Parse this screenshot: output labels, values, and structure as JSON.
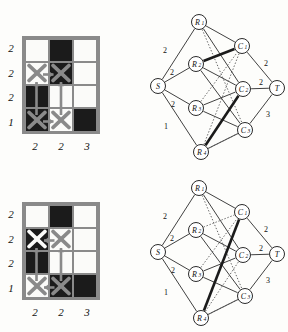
{
  "figure": {
    "panels": [
      {
        "id": "panel-top",
        "grid": {
          "row_labels": [
            "2",
            "2",
            "2",
            "1"
          ],
          "col_labels": [
            "2",
            "2",
            "3"
          ],
          "cells": [
            [
              {
                "fill": "white",
                "x": "none"
              },
              {
                "fill": "black",
                "x": "none"
              },
              {
                "fill": "white",
                "x": "none"
              }
            ],
            [
              {
                "fill": "white",
                "x": "gray"
              },
              {
                "fill": "black",
                "x": "gray"
              },
              {
                "fill": "white",
                "x": "none"
              }
            ],
            [
              {
                "fill": "black",
                "x": "none"
              },
              {
                "fill": "white",
                "x": "none"
              },
              {
                "fill": "white",
                "x": "none"
              }
            ],
            [
              {
                "fill": "black",
                "x": "gray"
              },
              {
                "fill": "white",
                "x": "gray"
              },
              {
                "fill": "black",
                "x": "none"
              }
            ]
          ],
          "arrows": [
            {
              "from": "r2c1",
              "to": "r2c2",
              "dir": "right"
            },
            {
              "from": "r4c1",
              "to": "r4c2",
              "dir": "right"
            },
            {
              "from": "r4c1",
              "to": "r2c1",
              "dir": "up"
            },
            {
              "from": "r4c2",
              "to": "r2c2",
              "dir": "up"
            }
          ]
        },
        "graph": {
          "nodes": [
            {
              "id": "S",
              "label": "S",
              "sub": "",
              "cx": 12,
              "cy": 80
            },
            {
              "id": "R1",
              "label": "R",
              "sub": "1",
              "cx": 53,
              "cy": 16
            },
            {
              "id": "R2",
              "label": "R",
              "sub": "2",
              "cx": 50,
              "cy": 58
            },
            {
              "id": "R3",
              "label": "R",
              "sub": "3",
              "cx": 50,
              "cy": 102
            },
            {
              "id": "R4",
              "label": "R",
              "sub": "4",
              "cx": 55,
              "cy": 146
            },
            {
              "id": "C1",
              "label": "C",
              "sub": "1",
              "cx": 96,
              "cy": 40
            },
            {
              "id": "C2",
              "label": "C",
              "sub": "2",
              "cx": 97,
              "cy": 83
            },
            {
              "id": "C3",
              "label": "C",
              "sub": "3",
              "cx": 99,
              "cy": 124
            },
            {
              "id": "T",
              "label": "T",
              "sub": "",
              "cx": 131,
              "cy": 82
            }
          ],
          "source_edges": [
            {
              "from": "S",
              "to": "R1",
              "weight": "2",
              "lx": 19,
              "ly": 44
            },
            {
              "from": "S",
              "to": "R2",
              "weight": "2",
              "lx": 26,
              "ly": 66
            },
            {
              "from": "S",
              "to": "R3",
              "weight": "2",
              "lx": 27,
              "ly": 98
            },
            {
              "from": "S",
              "to": "R4",
              "weight": "1",
              "lx": 20,
              "ly": 120
            }
          ],
          "sink_edges": [
            {
              "from": "C1",
              "to": "T",
              "weight": "2",
              "lx": 120,
              "ly": 57
            },
            {
              "from": "C2",
              "to": "T",
              "weight": "2",
              "lx": 115,
              "ly": 76
            },
            {
              "from": "C3",
              "to": "T",
              "weight": "3",
              "lx": 122,
              "ly": 108
            }
          ],
          "solid_edges": [
            {
              "from": "R1",
              "to": "C1"
            },
            {
              "from": "R1",
              "to": "C2"
            },
            {
              "from": "R2",
              "to": "C2"
            },
            {
              "from": "R2",
              "to": "C3"
            },
            {
              "from": "R3",
              "to": "C2"
            },
            {
              "from": "R3",
              "to": "C3"
            },
            {
              "from": "R4",
              "to": "C3"
            }
          ],
          "dotted_edges": [
            {
              "from": "R1",
              "to": "C3"
            },
            {
              "from": "R2",
              "to": "C1"
            },
            {
              "from": "R3",
              "to": "C1"
            },
            {
              "from": "R4",
              "to": "C1"
            },
            {
              "from": "R4",
              "to": "C2"
            },
            {
              "from": "R4",
              "to": "C3"
            }
          ],
          "thick_edges": [
            {
              "from": "R2",
              "to": "C1"
            },
            {
              "from": "R4",
              "to": "C2"
            }
          ]
        }
      },
      {
        "id": "panel-bottom",
        "grid": {
          "row_labels": [
            "2",
            "2",
            "2",
            "1"
          ],
          "col_labels": [
            "2",
            "2",
            "3"
          ],
          "cells": [
            [
              {
                "fill": "white",
                "x": "none"
              },
              {
                "fill": "black",
                "x": "none"
              },
              {
                "fill": "white",
                "x": "none"
              }
            ],
            [
              {
                "fill": "black",
                "x": "white"
              },
              {
                "fill": "white",
                "x": "gray"
              },
              {
                "fill": "white",
                "x": "none"
              }
            ],
            [
              {
                "fill": "black",
                "x": "none"
              },
              {
                "fill": "white",
                "x": "none"
              },
              {
                "fill": "white",
                "x": "none"
              }
            ],
            [
              {
                "fill": "white",
                "x": "gray"
              },
              {
                "fill": "black",
                "x": "gray"
              },
              {
                "fill": "black",
                "x": "none"
              }
            ]
          ],
          "arrows": [
            {
              "from": "r2c2",
              "to": "r2c1",
              "dir": "left"
            },
            {
              "from": "r4c2",
              "to": "r4c1",
              "dir": "left"
            },
            {
              "from": "r4c1",
              "to": "r2c1",
              "dir": "up"
            },
            {
              "from": "r4c2",
              "to": "r2c2",
              "dir": "up"
            }
          ]
        },
        "graph": {
          "nodes": [
            {
              "id": "S",
              "label": "S",
              "sub": "",
              "cx": 12,
              "cy": 80
            },
            {
              "id": "R1",
              "label": "R",
              "sub": "1",
              "cx": 53,
              "cy": 16
            },
            {
              "id": "R2",
              "label": "R",
              "sub": "2",
              "cx": 50,
              "cy": 58
            },
            {
              "id": "R3",
              "label": "R",
              "sub": "3",
              "cx": 50,
              "cy": 102
            },
            {
              "id": "R4",
              "label": "R",
              "sub": "4",
              "cx": 55,
              "cy": 146
            },
            {
              "id": "C1",
              "label": "C",
              "sub": "1",
              "cx": 96,
              "cy": 40
            },
            {
              "id": "C2",
              "label": "C",
              "sub": "2",
              "cx": 97,
              "cy": 83
            },
            {
              "id": "C3",
              "label": "C",
              "sub": "3",
              "cx": 99,
              "cy": 124
            },
            {
              "id": "T",
              "label": "T",
              "sub": "",
              "cx": 131,
              "cy": 82
            }
          ],
          "source_edges": [
            {
              "from": "S",
              "to": "R1",
              "weight": "2",
              "lx": 19,
              "ly": 44
            },
            {
              "from": "S",
              "to": "R2",
              "weight": "2",
              "lx": 26,
              "ly": 66
            },
            {
              "from": "S",
              "to": "R3",
              "weight": "2",
              "lx": 27,
              "ly": 98
            },
            {
              "from": "S",
              "to": "R4",
              "weight": "1",
              "lx": 20,
              "ly": 120
            }
          ],
          "sink_edges": [
            {
              "from": "C1",
              "to": "T",
              "weight": "2",
              "lx": 120,
              "ly": 57
            },
            {
              "from": "C2",
              "to": "T",
              "weight": "2",
              "lx": 115,
              "ly": 76
            },
            {
              "from": "C3",
              "to": "T",
              "weight": "3",
              "lx": 122,
              "ly": 108
            }
          ],
          "solid_edges": [
            {
              "from": "R1",
              "to": "C1"
            },
            {
              "from": "R1",
              "to": "C2"
            },
            {
              "from": "R2",
              "to": "C2"
            },
            {
              "from": "R2",
              "to": "C3"
            },
            {
              "from": "R3",
              "to": "C2"
            },
            {
              "from": "R3",
              "to": "C3"
            },
            {
              "from": "R4",
              "to": "C3"
            }
          ],
          "dotted_edges": [
            {
              "from": "R1",
              "to": "C3"
            },
            {
              "from": "R2",
              "to": "C1"
            },
            {
              "from": "R3",
              "to": "C1"
            },
            {
              "from": "R4",
              "to": "C1"
            },
            {
              "from": "R4",
              "to": "C2"
            },
            {
              "from": "R4",
              "to": "C3"
            }
          ],
          "thick_edges": [
            {
              "from": "R4",
              "to": "C1"
            }
          ]
        }
      }
    ]
  },
  "colors": {
    "filled_cell": "#1b1b1b",
    "empty_cell": "#fbfbf9",
    "grid_line": "#8a8a8a",
    "gray_mark": "#8a8a8a",
    "white_mark": "#fbfbf9",
    "node_stroke": "#2b2b2b",
    "background": "#fdfdfb"
  }
}
